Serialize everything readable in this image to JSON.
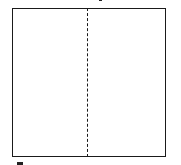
{
  "diagram": {
    "shape": "square",
    "fold_line": "vertical-dashed-center",
    "colors": {
      "stroke": "#1a1a1a",
      "background": "#ffffff"
    }
  }
}
